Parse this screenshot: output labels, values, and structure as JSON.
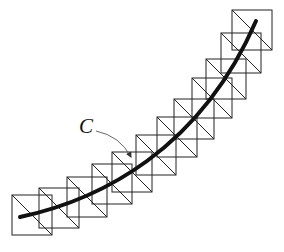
{
  "figure": {
    "label": "C",
    "colors": {
      "lines": "#222222",
      "curve": "#111111",
      "arrow": "#555555",
      "background": "#ffffff"
    },
    "square_size": 40,
    "squares": [
      {
        "x": 12,
        "y": 195
      },
      {
        "x": 39,
        "y": 188
      },
      {
        "x": 67,
        "y": 177
      },
      {
        "x": 92,
        "y": 164
      },
      {
        "x": 112,
        "y": 152
      },
      {
        "x": 136,
        "y": 135
      },
      {
        "x": 157,
        "y": 117
      },
      {
        "x": 174,
        "y": 99
      },
      {
        "x": 192,
        "y": 78
      },
      {
        "x": 206,
        "y": 59
      },
      {
        "x": 221,
        "y": 33
      },
      {
        "x": 232,
        "y": 10
      }
    ],
    "curve_path": "M20,217 C100,200 200,150 256,21",
    "arrow_path": "M96,131 Q120,136 131,157",
    "label_pos": {
      "x": 79,
      "y": 133
    }
  }
}
